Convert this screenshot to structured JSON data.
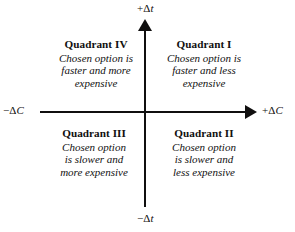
{
  "diagram": {
    "background_color": "#ffffff",
    "line_color": "#100f0f"
  },
  "axes": {
    "vertical": {
      "positive_label": "+Δt",
      "positive_sign": "+",
      "positive_delta": "Δ",
      "positive_var": "t",
      "negative_label": "−Δt",
      "negative_sign": "−",
      "negative_delta": "Δ",
      "negative_var": "t",
      "has_top_arrow": true,
      "has_bottom_arrow": false
    },
    "horizontal": {
      "positive_label": "+ΔC",
      "positive_sign": "+",
      "positive_delta": "Δ",
      "positive_var": "C",
      "negative_label": "−ΔC",
      "negative_sign": "−",
      "negative_delta": "Δ",
      "negative_var": "C",
      "has_right_arrow": true,
      "has_left_arrow": false
    }
  },
  "quadrants": [
    {
      "id": "quadrant-iv",
      "position": "upper-left",
      "title": "Quadrant IV",
      "lines": [
        "Chosen option is",
        "faster and more",
        "expensive"
      ],
      "line1": "Chosen option is",
      "line2": "faster and more",
      "line3": "expensive"
    },
    {
      "id": "quadrant-i",
      "position": "upper-right",
      "title": "Quadrant I",
      "lines": [
        "Chosen option is",
        "faster and less",
        "expensive"
      ],
      "line1": "Chosen option is",
      "line2": "faster and less",
      "line3": "expensive"
    },
    {
      "id": "quadrant-iii",
      "position": "lower-left",
      "title": "Quadrant III",
      "lines": [
        "Chosen option",
        "is slower and",
        "more expensive"
      ],
      "line1": "Chosen option",
      "line2": "is slower and",
      "line3": "more expensive"
    },
    {
      "id": "quadrant-ii",
      "position": "lower-right",
      "title": "Quadrant II",
      "lines": [
        "Chosen option",
        "is slower and",
        "less expensive"
      ],
      "line1": "Chosen option",
      "line2": "is slower and",
      "line3": "less expensive"
    }
  ]
}
